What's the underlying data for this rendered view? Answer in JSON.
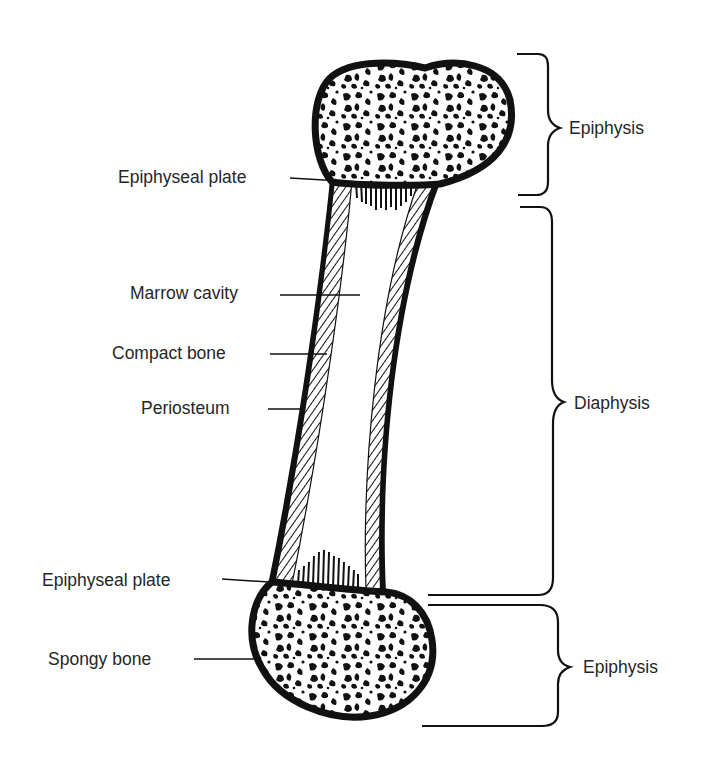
{
  "colors": {
    "ink": "#111111",
    "text": "#262626",
    "background": "#ffffff"
  },
  "left_labels": [
    {
      "id": "epiphyseal-plate-top",
      "text": "Epiphyseal plate"
    },
    {
      "id": "marrow-cavity",
      "text": "Marrow cavity"
    },
    {
      "id": "compact-bone",
      "text": "Compact bone"
    },
    {
      "id": "periosteum",
      "text": "Periosteum"
    },
    {
      "id": "epiphyseal-plate-bottom",
      "text": "Epiphyseal plate"
    },
    {
      "id": "spongy-bone",
      "text": "Spongy bone"
    }
  ],
  "right_labels": [
    {
      "id": "epiphysis-top",
      "text": "Epiphysis"
    },
    {
      "id": "diaphysis",
      "text": "Diaphysis"
    },
    {
      "id": "epiphysis-bottom",
      "text": "Epiphysis"
    }
  ]
}
